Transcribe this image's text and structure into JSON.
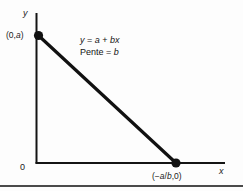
{
  "figure": {
    "background_color": "#fdfdfd",
    "ink_color": "#111111",
    "rule_color": "#4a4a4a"
  },
  "axes": {
    "y_label": "y",
    "x_label": "x",
    "origin_label": "0"
  },
  "annotations": {
    "equation": "y = a + bx",
    "slope": "Pente = b",
    "equation_parts": {
      "lhs": "y",
      "eq": "=",
      "intercept": "a",
      "plus": "+",
      "slope_term": "bx"
    },
    "slope_parts": {
      "word": "Pente",
      "eq": "=",
      "value": "b"
    }
  },
  "points": [
    {
      "name": "y-intercept",
      "label": "(0,a)",
      "x_px": 38,
      "y_px": 35
    },
    {
      "name": "x-intercept",
      "label": "(−a/b,0)",
      "x_px": 176,
      "y_px": 163
    }
  ],
  "chart_data": {
    "type": "line",
    "title": "",
    "xlabel": "x",
    "ylabel": "y",
    "series": [
      {
        "name": "y = a + bx",
        "points": [
          {
            "x": 0,
            "y": "a",
            "label": "(0,a)"
          },
          {
            "x": "-a/b",
            "y": 0,
            "label": "(−a/b,0)"
          }
        ]
      }
    ],
    "annotations": [
      "y = a + bx",
      "Pente = b"
    ],
    "grid": false,
    "legend": "none"
  }
}
